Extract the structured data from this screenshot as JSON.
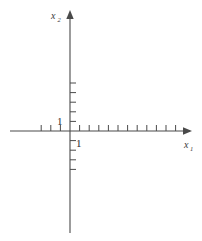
{
  "figure": {
    "kind": "cartesian-axes-diagram",
    "background_color": "#ffffff",
    "line_color": "#4a4a4a",
    "text_color": "#2e2e2e"
  },
  "axes": {
    "horizontal": {
      "name": "x",
      "subscript": "1",
      "label_full": "x1",
      "direction": "right",
      "has_arrow": true,
      "start_x": 10,
      "end_x": 190,
      "y": 131
    },
    "vertical": {
      "name": "x",
      "subscript": "2",
      "label_full": "x2",
      "direction": "up",
      "has_arrow": true,
      "start_y": 233,
      "end_y": 12,
      "x": 70
    }
  },
  "origin": {
    "x": 70,
    "y": 131
  },
  "ticks": {
    "spacing_px": 9.6,
    "length_px": 6,
    "x_axis": {
      "negative_count": 3,
      "positive_count": 11,
      "negative_offsets": [
        -1,
        -2,
        -3
      ],
      "positive_offsets": [
        1,
        2,
        3,
        4,
        5,
        6,
        7,
        8,
        9,
        10,
        11
      ]
    },
    "y_axis": {
      "positive_count": 5,
      "negative_count": 4,
      "positive_offsets": [
        1,
        2,
        3,
        4,
        5
      ],
      "negative_offsets": [
        -1,
        -2,
        -3,
        -4
      ],
      "tick_side": "right"
    }
  },
  "unit_labels": {
    "y_unit": {
      "text": "1",
      "x": 57,
      "y": 125,
      "describes": "unit mark on vertical axis"
    },
    "x_unit": {
      "text": "1",
      "x": 76,
      "y": 147,
      "describes": "unit mark on horizontal axis"
    }
  },
  "axis_labels": {
    "x_axis_label": {
      "base": "x",
      "sub": "1",
      "x": 184,
      "y": 148
    },
    "y_axis_label": {
      "base": "x",
      "sub": "2",
      "x": 52,
      "y": 19
    }
  }
}
